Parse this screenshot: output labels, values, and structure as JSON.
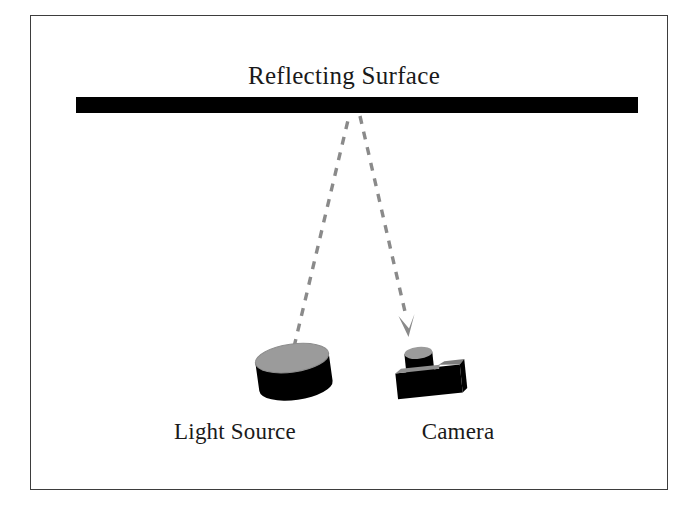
{
  "figure": {
    "type": "optics-setup-diagram",
    "background_color": "#ffffff",
    "frame": {
      "border_color": "#3d3d3d",
      "x": 30,
      "y": 15,
      "width": 638,
      "height": 475
    },
    "labels": {
      "reflecting_surface": "Reflecting Surface",
      "light_source": "Light Source",
      "camera": "Camera"
    },
    "colors": {
      "object_fill": "#000000",
      "object_top_highlight": "#9b9b9b",
      "ray_color": "#8a8a8a",
      "text_color": "#1a1a1a",
      "surface_color": "#000000"
    },
    "elements": {
      "reflecting_surface_bar": {
        "name": "reflecting-surface-bar",
        "x": 76,
        "y": 97,
        "width": 562,
        "height": 16,
        "fill": "#000000"
      },
      "incident_ray": {
        "name": "incident-ray",
        "description": "dashed ray from light source up to reflecting surface",
        "from_x": 293,
        "from_y": 347,
        "to_x": 349,
        "to_y": 115,
        "dash": "8 8",
        "stroke_width": 3.4,
        "color": "#8a8a8a",
        "arrowhead": false
      },
      "reflected_ray": {
        "name": "reflected-ray",
        "description": "dashed ray from reflecting surface down to camera with arrowhead",
        "from_x": 360,
        "from_y": 115,
        "to_x": 409,
        "to_y": 322,
        "dash": "8 8",
        "stroke_width": 3.4,
        "color": "#8a8a8a",
        "arrowhead": true,
        "arrow_tip_x": 408,
        "arrow_tip_y": 337
      },
      "light_source_cylinder": {
        "name": "light-source-cylinder",
        "center_x": 294,
        "center_y": 372,
        "radius_x": 37,
        "radius_y": 14,
        "body_height": 38,
        "tilt_deg": -8
      },
      "camera_body": {
        "name": "camera-body",
        "x": 397,
        "y": 366,
        "width": 64,
        "height": 30,
        "tilt_deg": -6
      },
      "camera_lens": {
        "name": "camera-lens-cylinder",
        "center_x": 421,
        "center_y": 356,
        "radius_x": 14,
        "radius_y": 6,
        "body_height": 18
      }
    }
  }
}
